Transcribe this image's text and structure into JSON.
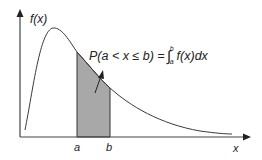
{
  "diagram": {
    "y_axis_label": "f(x)",
    "x_axis_label": "x",
    "lower_bound_label": "a",
    "upper_bound_label": "b",
    "formula": {
      "lhs": "P(a < x ≤ b) = ",
      "integral_symbol": "∫",
      "upper_limit": "b",
      "lower_limit": "a",
      "integrand": "f(x)dx"
    },
    "colors": {
      "curve": "#3a3a3a",
      "axis": "#333333",
      "shaded_area": "#a8a8a8",
      "background": "#ffffff"
    }
  }
}
